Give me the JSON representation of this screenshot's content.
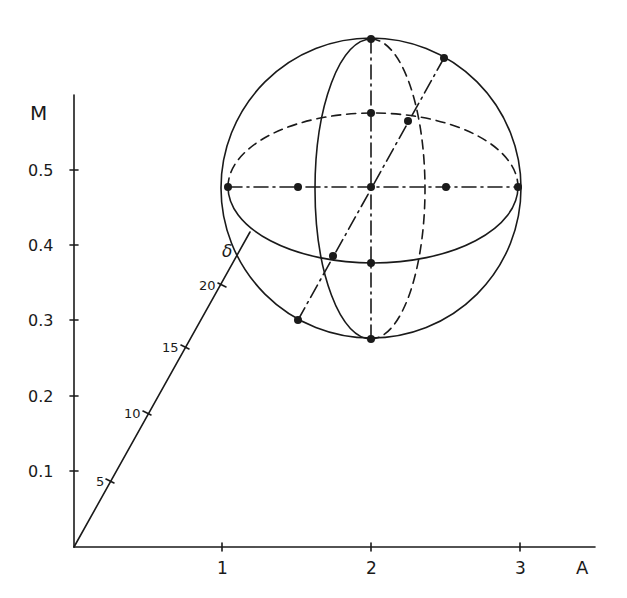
{
  "axes": {
    "origin": [
      74,
      547
    ],
    "x": {
      "label": "A",
      "end": 595,
      "ticks": [
        {
          "label": "1",
          "px": 222
        },
        {
          "label": "2",
          "px": 371
        },
        {
          "label": "3",
          "px": 520
        }
      ]
    },
    "y": {
      "label": "M",
      "end": 95,
      "ticks": [
        {
          "label": "0.1",
          "px": 471
        },
        {
          "label": "0.2",
          "px": 396
        },
        {
          "label": "0.3",
          "px": 320
        },
        {
          "label": "0.4",
          "px": 245
        },
        {
          "label": "0.5",
          "px": 170
        }
      ]
    }
  },
  "diagonal": {
    "from": [
      74,
      547
    ],
    "to": [
      250,
      232
    ],
    "label": "δ",
    "ticks": [
      {
        "label": "5",
        "at": [
          110,
          481
        ]
      },
      {
        "label": "10",
        "at": [
          147,
          413
        ]
      },
      {
        "label": "15",
        "at": [
          185,
          347
        ]
      },
      {
        "label": "20",
        "at": [
          222,
          285
        ]
      }
    ]
  },
  "sphere": {
    "center": [
      371,
      188
    ],
    "radius": 150,
    "points": [
      {
        "name": "top-pole",
        "at": [
          371,
          39
        ]
      },
      {
        "name": "bottom-pole",
        "at": [
          371,
          339
        ]
      },
      {
        "name": "left",
        "at": [
          228,
          187
        ]
      },
      {
        "name": "right",
        "at": [
          518,
          187
        ]
      },
      {
        "name": "center",
        "at": [
          371,
          187
        ]
      },
      {
        "name": "equator-left-inner",
        "at": [
          298,
          187
        ]
      },
      {
        "name": "equator-right-inner",
        "at": [
          446,
          187
        ]
      },
      {
        "name": "back-equator-top",
        "at": [
          371,
          113
        ]
      },
      {
        "name": "front-equator-bottom",
        "at": [
          371,
          263
        ]
      },
      {
        "name": "diag-upper-circle",
        "at": [
          444,
          58
        ]
      },
      {
        "name": "diag-back-equator",
        "at": [
          408,
          121
        ]
      },
      {
        "name": "diag-front-equator",
        "at": [
          333,
          256
        ]
      },
      {
        "name": "diag-lower-circle",
        "at": [
          298,
          320
        ]
      }
    ]
  }
}
